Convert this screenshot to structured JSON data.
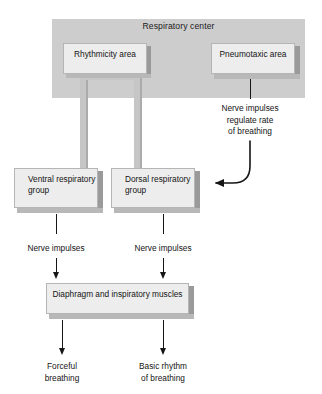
{
  "diagram": {
    "title": "Respiratory center",
    "region_label": "Respiratory center",
    "boxes": {
      "rhythmicity": "Rhythmicity\narea",
      "pneumotaxic": "Pneumotaxic\narea",
      "ventral": "Ventral\nrespiratory\ngroup",
      "dorsal": "Dorsal\nrespiratory\ngroup",
      "diaphragm": "Diaphragm and\ninspiratory muscles"
    },
    "captions": {
      "regulate": "Nerve impulses\nregulate rate\nof breathing",
      "nerve_impulses_left": "Nerve impulses",
      "nerve_impulses_right": "Nerve impulses",
      "forceful": "Forceful\nbreathing",
      "basic_rhythm": "Basic rhythm\nof breathing"
    },
    "colors": {
      "region_fill": "#cdcdcd",
      "box_fill": "#ededed",
      "box_side": "#9a9a9a",
      "box_bottom": "#b8b8b8",
      "connector": "#c6c6c6",
      "ink": "#161616"
    }
  }
}
